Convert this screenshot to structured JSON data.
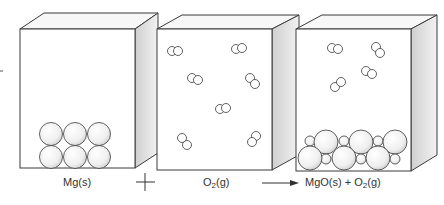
{
  "panels": [
    {
      "id": "reactant-mg",
      "label": "Mg(s)",
      "state": "solid",
      "particles": "6 Mg atoms in 2x3 lattice"
    },
    {
      "id": "reactant-o2",
      "label_main": "O",
      "label_sub": "2",
      "label_tail": "(g)",
      "state": "gas",
      "particles": "8 O2 molecules"
    },
    {
      "id": "product",
      "label_part1": "MgO(s) + O",
      "label_sub": "2",
      "label_tail": "(g)",
      "state": "solid + gas",
      "particles": "MgO lattice with 4 remaining O2 molecules"
    }
  ],
  "operators": {
    "plus": "+",
    "arrow": "→"
  },
  "colors": {
    "line": "#3a3a3a",
    "side_shade": "#d9d9d9",
    "top_fill": "#f4f4f4",
    "sphere": "#f2f2f2"
  }
}
